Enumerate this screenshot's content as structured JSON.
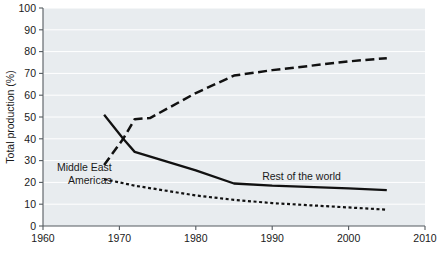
{
  "chart_data": {
    "type": "line",
    "title": "",
    "xlabel": "",
    "ylabel": "Total production (%)",
    "xlim": [
      1960,
      2010
    ],
    "ylim": [
      0,
      100
    ],
    "xticks": [
      1960,
      1970,
      1980,
      1990,
      2000,
      2010
    ],
    "yticks": [
      0,
      10,
      20,
      30,
      40,
      50,
      60,
      70,
      80,
      90,
      100
    ],
    "xtick_labels": [
      "1960",
      "1970",
      "1980",
      "1990",
      "2000",
      "2010"
    ],
    "ytick_labels": [
      "0",
      "10",
      "20",
      "30",
      "40",
      "50",
      "60",
      "70",
      "80",
      "90",
      "100"
    ],
    "grid": "horizontal",
    "legend_position": "inline-annotations",
    "background_color": "#e8ecef",
    "gridline_color": "#ffffff",
    "line_color": "#111111",
    "series": [
      {
        "name": "Middle East",
        "style": "long-dash",
        "label_x": 1969,
        "label_y": 27,
        "points": [
          {
            "x": 1968,
            "y": 28.0
          },
          {
            "x": 1970.5,
            "y": 40.0
          },
          {
            "x": 1972,
            "y": 49.0
          },
          {
            "x": 1974,
            "y": 49.5
          },
          {
            "x": 1980,
            "y": 61.0
          },
          {
            "x": 1985,
            "y": 69.0
          },
          {
            "x": 1990,
            "y": 71.5
          },
          {
            "x": 1995,
            "y": 73.5
          },
          {
            "x": 2000,
            "y": 75.5
          },
          {
            "x": 2005,
            "y": 77.0
          }
        ]
      },
      {
        "name": "Rest of the world",
        "style": "solid",
        "label_x": 1999,
        "label_y": 23,
        "points": [
          {
            "x": 1968,
            "y": 51.0
          },
          {
            "x": 1970.5,
            "y": 40.0
          },
          {
            "x": 1972,
            "y": 34.0
          },
          {
            "x": 1980,
            "y": 25.5
          },
          {
            "x": 1985,
            "y": 19.5
          },
          {
            "x": 1990,
            "y": 18.5
          },
          {
            "x": 2000,
            "y": 17.3
          },
          {
            "x": 2005,
            "y": 16.5
          }
        ]
      },
      {
        "name": "Americas",
        "style": "dotted",
        "label_x": 1969,
        "label_y": 21,
        "points": [
          {
            "x": 1968,
            "y": 21.5
          },
          {
            "x": 1972,
            "y": 18.5
          },
          {
            "x": 1980,
            "y": 14.0
          },
          {
            "x": 1985,
            "y": 12.0
          },
          {
            "x": 1990,
            "y": 10.5
          },
          {
            "x": 1995,
            "y": 9.5
          },
          {
            "x": 2000,
            "y": 8.5
          },
          {
            "x": 2005,
            "y": 7.5
          }
        ]
      }
    ]
  }
}
